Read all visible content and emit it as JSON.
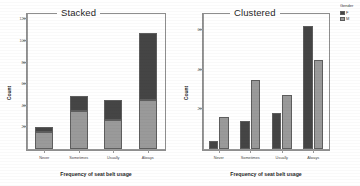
{
  "colors": {
    "series_1": "#454545",
    "series_2": "#9a9a9a",
    "bar_outline": "#5e5e5e",
    "axis": "#9a9a9a",
    "frame": "#8e8e8e",
    "text": "#1f1f1f",
    "background": "#ffffff"
  },
  "legend": {
    "title": "Gender",
    "items": [
      {
        "label": "F",
        "color": "#454545"
      },
      {
        "label": "M",
        "color": "#9a9a9a"
      }
    ]
  },
  "chart_data": [
    {
      "type": "bar",
      "title": "Stacked",
      "stacked": true,
      "xlabel": "Frequency of seat belt usage",
      "ylabel": "Count",
      "categories": [
        "Never",
        "Sometimes",
        "Usually",
        "Always"
      ],
      "ylim": [
        0,
        125
      ],
      "yticks": [
        20,
        40,
        60,
        80,
        100,
        120
      ],
      "ytick_labels": [
        "20",
        "40",
        "60",
        "80",
        "100",
        "120"
      ],
      "grid": false,
      "legend_position": "right-outside",
      "series": [
        {
          "name": "M",
          "color": "#9a9a9a",
          "values": [
            16,
            35,
            27,
            45
          ]
        },
        {
          "name": "F",
          "color": "#454545",
          "values": [
            4,
            14,
            18,
            62
          ]
        }
      ],
      "totals": [
        20,
        49,
        45,
        107
      ]
    },
    {
      "type": "bar",
      "title": "Clustered",
      "stacked": false,
      "xlabel": "Frequency of seat belt usage",
      "ylabel": "Count",
      "categories": [
        "Never",
        "Sometimes",
        "Usually",
        "Always"
      ],
      "ylim": [
        0,
        68
      ],
      "yticks": [
        20,
        40,
        60
      ],
      "ytick_labels": [
        "20",
        "40",
        "60"
      ],
      "grid": false,
      "legend_position": "right-outside",
      "series": [
        {
          "name": "F",
          "color": "#454545",
          "values": [
            4,
            14,
            18,
            62
          ]
        },
        {
          "name": "M",
          "color": "#9a9a9a",
          "values": [
            16,
            35,
            27,
            45
          ]
        }
      ]
    }
  ]
}
